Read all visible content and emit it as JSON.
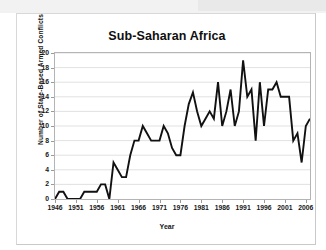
{
  "chart_data": {
    "type": "line",
    "title": "Sub-Saharan Africa",
    "xlabel": "Year",
    "ylabel": "Number of State-Based Armed Conflicts",
    "xlim": [
      1946,
      2007
    ],
    "ylim": [
      0,
      20
    ],
    "ytick_step": 2,
    "xtick_step": 5,
    "grid": "horizontal",
    "legend": "none",
    "line_color": "#111111",
    "plot_background": "#ffffff",
    "ytick_labels": [
      "0",
      "2",
      "4",
      "6",
      "8",
      "10",
      "12",
      "14",
      "16",
      "18",
      "20"
    ],
    "ytick_values": [
      0,
      2,
      4,
      6,
      8,
      10,
      12,
      14,
      16,
      18,
      20
    ],
    "xtick_labels": [
      "1946",
      "1951",
      "1956",
      "1961",
      "1966",
      "1971",
      "1976",
      "1981",
      "1986",
      "1991",
      "1996",
      "2001",
      "2006"
    ],
    "xtick_values": [
      1946,
      1951,
      1956,
      1961,
      1966,
      1971,
      1976,
      1981,
      1986,
      1991,
      1996,
      2001,
      2006
    ],
    "x": [
      1946,
      1947,
      1948,
      1949,
      1950,
      1951,
      1952,
      1953,
      1954,
      1955,
      1956,
      1957,
      1958,
      1959,
      1960,
      1961,
      1962,
      1963,
      1964,
      1965,
      1966,
      1967,
      1968,
      1969,
      1970,
      1971,
      1972,
      1973,
      1974,
      1975,
      1976,
      1977,
      1978,
      1979,
      1980,
      1981,
      1982,
      1983,
      1984,
      1985,
      1986,
      1987,
      1988,
      1989,
      1990,
      1991,
      1992,
      1993,
      1994,
      1995,
      1996,
      1997,
      1998,
      1999,
      2000,
      2001,
      2002,
      2003,
      2004,
      2005,
      2006,
      2007
    ],
    "values": [
      0,
      1,
      1,
      0,
      0,
      0,
      0,
      1,
      1,
      1,
      1,
      2,
      2,
      0,
      5,
      4,
      3,
      3,
      6,
      8,
      8,
      10,
      9,
      8,
      8,
      8,
      10,
      9,
      7,
      6,
      6,
      10,
      13,
      14.6,
      12,
      10,
      11,
      12,
      11,
      16,
      10,
      12,
      15,
      10,
      12,
      19,
      14,
      15,
      8,
      16,
      10,
      15,
      15,
      16,
      14,
      14,
      14,
      8,
      9,
      5,
      10,
      11
    ],
    "series": [
      {
        "name": "State-based armed conflicts",
        "values": [
          0,
          1,
          1,
          0,
          0,
          0,
          0,
          1,
          1,
          1,
          1,
          2,
          2,
          0,
          5,
          4,
          3,
          3,
          6,
          8,
          8,
          10,
          9,
          8,
          8,
          8,
          10,
          9,
          7,
          6,
          6,
          10,
          13,
          14.6,
          12,
          10,
          11,
          12,
          11,
          16,
          10,
          12,
          15,
          10,
          12,
          19,
          14,
          15,
          8,
          16,
          10,
          15,
          15,
          16,
          14,
          14,
          14,
          8,
          9,
          5,
          10,
          11
        ]
      }
    ]
  }
}
